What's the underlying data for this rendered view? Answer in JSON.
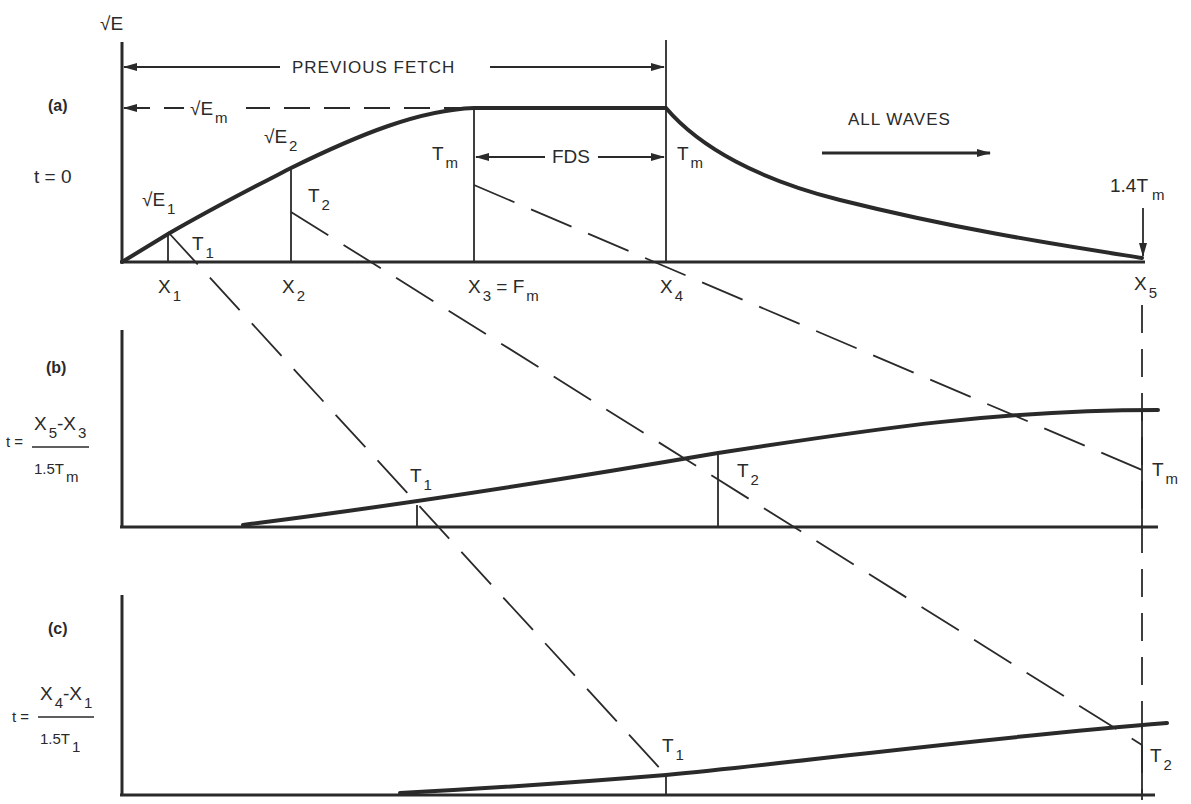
{
  "colors": {
    "ink": "#2a2a2a",
    "background": "#ffffff"
  },
  "panel_a": {
    "tag": "(a)",
    "time_label": "t = 0",
    "y_axis_label": "√E",
    "previous_fetch": "PREVIOUS FETCH",
    "em_label": "√E",
    "em_sub": "m",
    "e1_label": "√E",
    "e1_sub": "1",
    "e2_label": "√E",
    "e2_sub": "2",
    "t1_label": "T",
    "t1_sub": "1",
    "t2_label": "T",
    "t2_sub": "2",
    "tm_label_left": "T",
    "tm_sub_left": "m",
    "tm_label_right": "T",
    "tm_sub_right": "m",
    "fds_label": "FDS",
    "all_waves": "ALL WAVES",
    "t14_label": "1.4T",
    "t14_sub": "m",
    "x_labels": [
      {
        "main": "X",
        "sub": "1",
        "extra": ""
      },
      {
        "main": "X",
        "sub": "2",
        "extra": ""
      },
      {
        "main": "X",
        "sub": "3",
        "extra": " = F",
        "extra_sub": "m"
      },
      {
        "main": "X",
        "sub": "4",
        "extra": ""
      },
      {
        "main": "X",
        "sub": "5",
        "extra": ""
      }
    ]
  },
  "panel_b": {
    "tag": "(b)",
    "time_prefix": "t =",
    "numerator_a": "X",
    "numerator_a_sub": "5",
    "numerator_mid": "-X",
    "numerator_b_sub": "3",
    "denominator": "1.5T",
    "denominator_sub": "m",
    "t1_label": "T",
    "t1_sub": "1",
    "t2_label": "T",
    "t2_sub": "2",
    "tm_label": "T",
    "tm_sub": "m"
  },
  "panel_c": {
    "tag": "(c)",
    "time_prefix": "t =",
    "numerator_a": "X",
    "numerator_a_sub": "4",
    "numerator_mid": "-X",
    "numerator_b_sub": "1",
    "denominator": "1.5T",
    "denominator_sub": "1",
    "t1_label": "T",
    "t1_sub": "1",
    "t2_label": "T",
    "t2_sub": "2"
  }
}
